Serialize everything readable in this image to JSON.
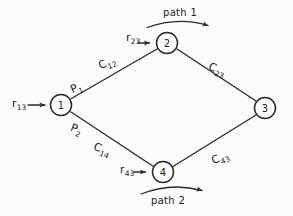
{
  "diagram": {
    "background_color": "#fbfbfb",
    "ink_color": "#2b2b2b",
    "nodes": [
      {
        "id": "1",
        "label": "1",
        "cx": 61,
        "cy": 105
      },
      {
        "id": "2",
        "label": "2",
        "cx": 167,
        "cy": 43
      },
      {
        "id": "3",
        "label": "3",
        "cx": 265,
        "cy": 108
      },
      {
        "id": "4",
        "label": "4",
        "cx": 163,
        "cy": 172
      }
    ],
    "edges": [
      {
        "from": "1",
        "to": "2",
        "label_base": "C",
        "label_sub": "12"
      },
      {
        "from": "2",
        "to": "3",
        "label_base": "C",
        "label_sub": "23"
      },
      {
        "from": "1",
        "to": "4",
        "label_base": "C",
        "label_sub": "14"
      },
      {
        "from": "4",
        "to": "3",
        "label_base": "C",
        "label_sub": "43"
      }
    ],
    "edge_labels": {
      "c12_base": "C",
      "c12_sub": "12",
      "c23_base": "C",
      "c23_sub": "23",
      "c14_base": "C",
      "c14_sub": "14",
      "c43_base": "C",
      "c43_sub": "43"
    },
    "path_split_labels": {
      "p1_base": "P",
      "p1_sub": "1",
      "p2_base": "P",
      "p2_sub": "2"
    },
    "external_inputs": [
      {
        "base": "r",
        "sub": "13",
        "target_node": "1"
      },
      {
        "base": "r",
        "sub": "23",
        "target_node": "2"
      },
      {
        "base": "r",
        "sub": "43",
        "target_node": "4"
      }
    ],
    "input_labels": {
      "r13_base": "r",
      "r13_sub": "13",
      "r23_base": "r",
      "r23_sub": "23",
      "r43_base": "r",
      "r43_sub": "43"
    },
    "path_annotations": {
      "path1": "path 1",
      "path2": "path 2"
    }
  }
}
